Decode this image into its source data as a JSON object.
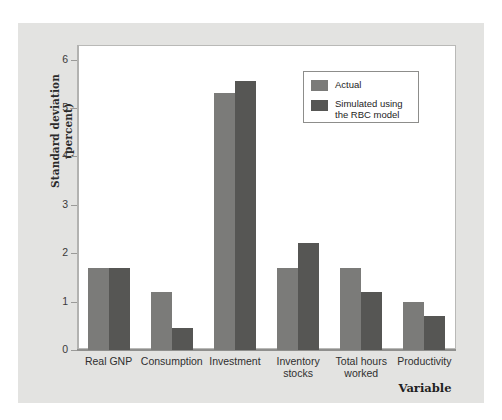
{
  "chart_data": {
    "type": "bar",
    "title": "",
    "xlabel": "Variable",
    "ylabel": "Standard deviation (percent)",
    "ylabel_line1": "Standard deviation",
    "ylabel_line2": "(percent)",
    "categories": [
      "Real GNP",
      "Consumption",
      "Investment",
      "Inventory stocks",
      "Total hours worked",
      "Productivity"
    ],
    "category_lines": [
      [
        "Real GNP"
      ],
      [
        "Consumption"
      ],
      [
        "Investment"
      ],
      [
        "Inventory",
        "stocks"
      ],
      [
        "Total hours",
        "worked"
      ],
      [
        "Productivity"
      ]
    ],
    "series": [
      {
        "name": "Actual",
        "color": "#7b7b79",
        "values": [
          1.7,
          1.2,
          5.3,
          1.7,
          1.7,
          1.0
        ]
      },
      {
        "name": "Simulated using the RBC model",
        "name_line1": "Simulated using",
        "name_line2": "the RBC model",
        "color": "#565654",
        "values": [
          1.7,
          0.45,
          5.55,
          2.2,
          1.2,
          0.7
        ]
      }
    ],
    "ylim": [
      0,
      6.3
    ],
    "yticks": [
      0,
      1,
      2,
      3,
      4,
      5,
      6
    ],
    "ytick_labels": [
      "0",
      "1",
      "2",
      "3",
      "4",
      "5",
      "6"
    ],
    "grid": false,
    "legend_position": "upper-right"
  },
  "legend": {
    "entries": [
      {
        "label": "Actual",
        "line1": "Actual",
        "line2": ""
      },
      {
        "label": "Simulated using the RBC model",
        "line1": "Simulated using",
        "line2": "the RBC model"
      }
    ]
  },
  "colors": {
    "actual": "#7b7b79",
    "simulated": "#565654",
    "panel_background": "#e3e3e1",
    "plot_background": "#ffffff",
    "axis": "#8f8f8d",
    "text": "#2a2a2a"
  }
}
